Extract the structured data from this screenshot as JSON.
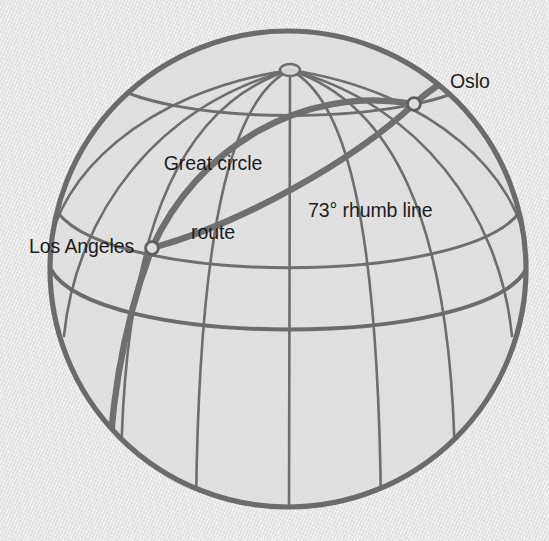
{
  "figure": {
    "kind": "globe-orthographic-diagram",
    "background_color": "#e8e8e8",
    "sphere_fill": "#dedede",
    "graticule_color": "#6e6e6e",
    "outline_color": "#6b6b6b",
    "route_color": "#6b6b6b",
    "label_color": "#1d1d1d"
  },
  "labels": {
    "great_circle": "Great circle\nroute",
    "great_circle_line1": "Great circle",
    "great_circle_line2": "route",
    "rhumb": "73° rhumb line",
    "oslo": "Oslo",
    "los_angeles": "Los Angeles"
  },
  "points": [
    {
      "name": "los-angeles",
      "label": "Los Angeles",
      "cx": 152,
      "cy": 248,
      "r": 6.5
    },
    {
      "name": "oslo",
      "label": "Oslo",
      "cx": 414,
      "cy": 104,
      "r": 6.5
    }
  ],
  "geometry": {
    "center_x": 288,
    "center_y": 269,
    "radius": 239,
    "pole_x": 290,
    "pole_y": 70,
    "equator_center_y": 343
  },
  "routes": [
    {
      "name": "great-circle-route",
      "label": "Great circle route",
      "style": "thick"
    },
    {
      "name": "rhumb-line-route",
      "label": "73° rhumb line",
      "style": "thick"
    }
  ]
}
